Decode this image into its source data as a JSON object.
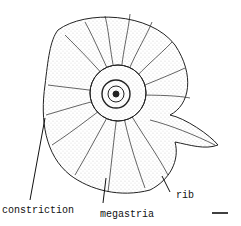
{
  "figure": {
    "labels": {
      "constriction": "constriction",
      "megastria": "megastria",
      "rib": "rib"
    },
    "scale_bar": true
  }
}
